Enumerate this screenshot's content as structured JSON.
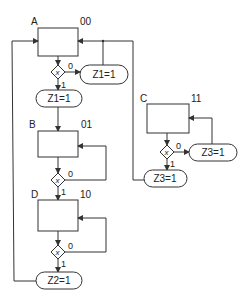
{
  "diagram": {
    "type": "ASM chart (algorithmic state machine)",
    "states": [
      {
        "name": "A",
        "code": "00"
      },
      {
        "name": "B",
        "code": "01"
      },
      {
        "name": "C",
        "code": "11"
      },
      {
        "name": "D",
        "code": "10"
      }
    ],
    "decisions": {
      "variable": "x",
      "zero_label": "0",
      "one_label": "1"
    },
    "outputs": {
      "a_zero": "Z1=1",
      "a_one": "Z1=1",
      "c_zero": "Z3=1",
      "c_one": "Z3=1",
      "d_one": "Z2=1"
    }
  }
}
